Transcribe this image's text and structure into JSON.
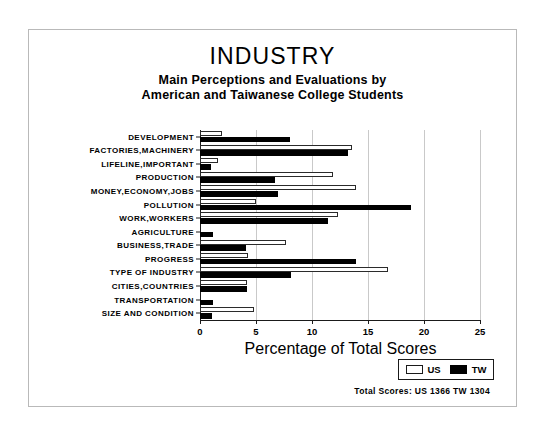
{
  "chart_data": {
    "type": "bar",
    "orientation": "horizontal",
    "title": "INDUSTRY",
    "subtitle_line1": "Main Perceptions and Evaluations by",
    "subtitle_line2": "American and Taiwanese College Students",
    "xlabel": "Percentage of Total Scores",
    "ylabel": "",
    "xlim": [
      0,
      25
    ],
    "xticks": [
      0,
      5,
      10,
      15,
      20,
      25
    ],
    "xtick_labels": [
      "0",
      "5",
      "10",
      "15",
      "20",
      "25"
    ],
    "grid": true,
    "legend_position": "bottom-right",
    "categories": [
      "DEVELOPMENT",
      "FACTORIES,MACHINERY",
      "LIFELINE,IMPORTANT",
      "PRODUCTION",
      "MONEY,ECONOMY,JOBS",
      "POLLUTION",
      "WORK,WORKERS",
      "AGRICULTURE",
      "BUSINESS,TRADE",
      "PROGRESS",
      "TYPE OF INDUSTRY",
      "CITIES,COUNTRIES",
      "TRANSPORTATION",
      "SIZE AND CONDITION"
    ],
    "series": [
      {
        "name": "US",
        "color": "#ffffff",
        "edge_color": "#2b2b2b",
        "values": [
          2.0,
          13.6,
          1.6,
          11.9,
          13.9,
          5.0,
          12.3,
          0.0,
          7.7,
          4.3,
          16.8,
          4.2,
          0.0,
          4.8
        ]
      },
      {
        "name": "TW",
        "color": "#000000",
        "edge_color": "#000000",
        "values": [
          8.0,
          13.2,
          1.0,
          6.7,
          7.0,
          18.8,
          11.4,
          1.2,
          4.1,
          13.9,
          8.1,
          4.2,
          1.2,
          1.1
        ]
      }
    ]
  },
  "legend": {
    "items": [
      {
        "label": "US",
        "swatch": "hollow"
      },
      {
        "label": "TW",
        "swatch": "filled"
      }
    ]
  },
  "footer": {
    "totals": "Total Scores:  US 1366  TW 1304"
  }
}
